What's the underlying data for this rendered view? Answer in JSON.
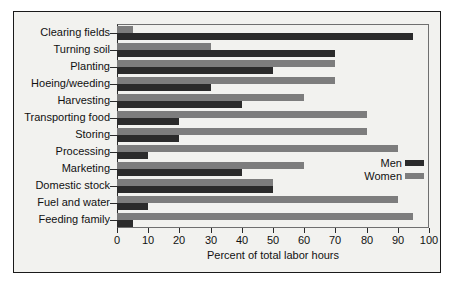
{
  "chart_data": {
    "type": "bar",
    "orientation": "horizontal",
    "title": "",
    "xlabel": "Percent of total labor hours",
    "ylabel": "",
    "xlim": [
      0,
      100
    ],
    "xticks": [
      0,
      10,
      20,
      30,
      40,
      50,
      60,
      70,
      80,
      90,
      100
    ],
    "xtick_labels": [
      "0",
      "10",
      "20",
      "30",
      "40",
      "50",
      "60",
      "70",
      "80",
      "90",
      "100"
    ],
    "grid": false,
    "legend_position": "middle-right",
    "categories": [
      "Clearing fields",
      "Turning soil",
      "Planting",
      "Hoeing/weeding",
      "Harvesting",
      "Transporting food",
      "Storing",
      "Processing",
      "Marketing",
      "Domestic stock",
      "Fuel and water",
      "Feeding family"
    ],
    "series": [
      {
        "name": "Men",
        "color": "#2b2b2b",
        "values": [
          95,
          70,
          50,
          30,
          40,
          20,
          20,
          10,
          40,
          50,
          10,
          5
        ]
      },
      {
        "name": "Women",
        "color": "#7d7d7d",
        "values": [
          5,
          30,
          70,
          70,
          60,
          80,
          80,
          90,
          60,
          50,
          90,
          95
        ]
      }
    ]
  },
  "legend": {
    "items": [
      {
        "label": "Men",
        "color": "#2b2b2b"
      },
      {
        "label": "Women",
        "color": "#7d7d7d"
      }
    ]
  },
  "axis": {
    "x_title": "Percent of total labor hours"
  }
}
